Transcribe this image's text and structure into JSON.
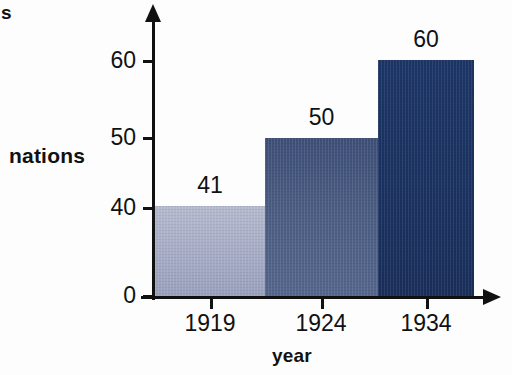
{
  "chart_data": {
    "type": "bar",
    "title": "",
    "subtitle": "",
    "xlabel": "year",
    "ylabel": "nations",
    "clipped_label": "s",
    "categories": [
      "1919",
      "1924",
      "1934"
    ],
    "values": [
      41,
      50,
      60
    ],
    "value_labels": [
      "41",
      "50",
      "60"
    ],
    "series": [
      {
        "name": "nations",
        "values": [
          41,
          50,
          60
        ]
      }
    ],
    "y_ticks": [
      "0",
      "40",
      "50",
      "60"
    ],
    "y_tick_values": [
      0,
      40,
      50,
      60
    ],
    "ylim": [
      0,
      65
    ],
    "axis_note": "broken y-axis: region between 0 and 40 is compressed",
    "grid": false,
    "legend": "none",
    "bar_colors": [
      "#a9afc7",
      "#4b5d83",
      "#1b3362"
    ],
    "axis_color": "#111111",
    "background_color": "#fdfdfd"
  },
  "bars": [
    {
      "category": "1919",
      "value_label": "41",
      "color": "#a9afc7",
      "color_top": "#b5bace",
      "color_bottom": "#9aa1bc",
      "left": 155,
      "width": 110,
      "height": 91,
      "label_left": 155,
      "label_top": 174
    },
    {
      "category": "1924",
      "value_label": "50",
      "color": "#4b5d83",
      "color_top": "#3f5078",
      "color_bottom": "#55678c",
      "left": 265,
      "width": 113,
      "height": 159,
      "label_left": 265,
      "label_top": 106
    },
    {
      "category": "1934",
      "value_label": "60",
      "color": "#1b3362",
      "color_top": "#1d3566",
      "color_bottom": "#192e5a",
      "left": 378,
      "width": 96,
      "height": 237,
      "label_left": 378,
      "label_top": 28
    }
  ],
  "y_axis": {
    "ticks": [
      {
        "label": "60",
        "top": 60
      },
      {
        "label": "50",
        "top": 137
      },
      {
        "label": "40",
        "top": 207
      },
      {
        "label": "0",
        "top": 295
      }
    ]
  },
  "x_axis": {
    "ticks": [
      {
        "label": "1919",
        "center": 210
      },
      {
        "label": "1924",
        "center": 321
      },
      {
        "label": "1934",
        "center": 426
      }
    ]
  }
}
